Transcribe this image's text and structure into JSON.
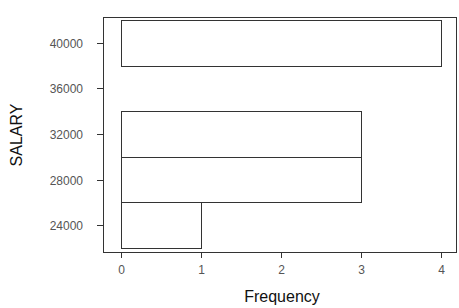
{
  "chart_data": {
    "type": "bar",
    "orientation": "horizontal",
    "subtype": "histogram",
    "title": "",
    "xlabel": "Frequency",
    "ylabel": "SALARY",
    "bins": [
      {
        "from": 22000,
        "to": 26000,
        "count": 1
      },
      {
        "from": 26000,
        "to": 30000,
        "count": 3
      },
      {
        "from": 30000,
        "to": 34000,
        "count": 3
      },
      {
        "from": 34000,
        "to": 38000,
        "count": 0
      },
      {
        "from": 38000,
        "to": 42000,
        "count": 4
      }
    ],
    "categories": [
      "22000-26000",
      "26000-30000",
      "30000-34000",
      "34000-38000",
      "38000-42000"
    ],
    "values": [
      1,
      3,
      3,
      0,
      4
    ],
    "xticks": [
      "0",
      "1",
      "2",
      "3",
      "4"
    ],
    "yticks": [
      "24000",
      "28000",
      "32000",
      "36000",
      "40000"
    ],
    "xlim": [
      0,
      4
    ],
    "ylim": [
      22000,
      42000
    ],
    "grid": false,
    "legend": null
  }
}
